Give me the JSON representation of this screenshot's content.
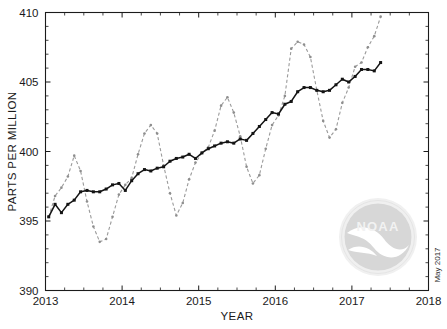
{
  "figure": {
    "watermark_label": "NOAA",
    "date_stamp": "May 2017",
    "logo_name": "noaa-logo-watermark"
  },
  "chart_data": {
    "type": "line",
    "title": "",
    "xlabel": "YEAR",
    "ylabel": "PARTS PER MILLION",
    "xlim": [
      2013,
      2018
    ],
    "ylim": [
      390,
      410
    ],
    "xticks": [
      2013,
      2014,
      2015,
      2016,
      2017,
      2018
    ],
    "xtick_labels": [
      "2013",
      "2014",
      "2015",
      "2016",
      "2017",
      "2018"
    ],
    "yticks": [
      390,
      395,
      400,
      405,
      410
    ],
    "ytick_labels": [
      "390",
      "395",
      "400",
      "405",
      "410"
    ],
    "x_minor_tick_interval": 0.25,
    "y_minor_tick_interval": 1,
    "grid": false,
    "legend_position": "none",
    "series": [
      {
        "name": "Monthly mean CO2",
        "style": "dashed",
        "color": "#9a9a9a",
        "marker": "dot",
        "x": [
          2013.042,
          2013.125,
          2013.208,
          2013.292,
          2013.375,
          2013.458,
          2013.542,
          2013.625,
          2013.708,
          2013.792,
          2013.875,
          2013.958,
          2014.042,
          2014.125,
          2014.208,
          2014.292,
          2014.375,
          2014.458,
          2014.542,
          2014.625,
          2014.708,
          2014.792,
          2014.875,
          2014.958,
          2015.042,
          2015.125,
          2015.208,
          2015.292,
          2015.375,
          2015.458,
          2015.542,
          2015.625,
          2015.708,
          2015.792,
          2015.875,
          2015.958,
          2016.042,
          2016.125,
          2016.208,
          2016.292,
          2016.375,
          2016.458,
          2016.542,
          2016.625,
          2016.708,
          2016.792,
          2016.875,
          2016.958,
          2017.042,
          2017.125,
          2017.208,
          2017.292,
          2017.375
        ],
        "values": [
          395.3,
          396.8,
          397.4,
          398.2,
          399.7,
          398.6,
          396.4,
          394.6,
          393.5,
          393.7,
          395.3,
          396.9,
          397.6,
          398.1,
          399.8,
          401.3,
          401.9,
          401.3,
          399.0,
          397.0,
          395.4,
          396.3,
          398.0,
          399.2,
          399.9,
          400.3,
          401.5,
          403.3,
          403.9,
          402.8,
          401.1,
          398.9,
          397.7,
          398.3,
          400.2,
          401.9,
          402.6,
          404.0,
          407.4,
          407.9,
          407.7,
          406.8,
          404.4,
          402.2,
          401.0,
          401.6,
          403.5,
          404.6,
          406.1,
          406.4,
          407.5,
          408.3,
          409.7
        ]
      },
      {
        "name": "Trend (seasonally corrected)",
        "style": "solid",
        "color": "#141414",
        "marker": "square",
        "x": [
          2013.042,
          2013.125,
          2013.208,
          2013.292,
          2013.375,
          2013.458,
          2013.542,
          2013.625,
          2013.708,
          2013.792,
          2013.875,
          2013.958,
          2014.042,
          2014.125,
          2014.208,
          2014.292,
          2014.375,
          2014.458,
          2014.542,
          2014.625,
          2014.708,
          2014.792,
          2014.875,
          2014.958,
          2015.042,
          2015.125,
          2015.208,
          2015.292,
          2015.375,
          2015.458,
          2015.542,
          2015.625,
          2015.708,
          2015.792,
          2015.875,
          2015.958,
          2016.042,
          2016.125,
          2016.208,
          2016.292,
          2016.375,
          2016.458,
          2016.542,
          2016.625,
          2016.708,
          2016.792,
          2016.875,
          2016.958,
          2017.042,
          2017.125,
          2017.208,
          2017.292,
          2017.375
        ],
        "values": [
          395.3,
          396.2,
          395.6,
          396.2,
          396.5,
          397.1,
          397.2,
          397.1,
          397.1,
          397.3,
          397.6,
          397.7,
          397.2,
          397.9,
          398.4,
          398.7,
          398.6,
          398.8,
          398.9,
          399.3,
          399.5,
          399.6,
          399.8,
          399.5,
          399.9,
          400.2,
          400.4,
          400.6,
          400.7,
          400.6,
          400.9,
          400.8,
          401.3,
          401.8,
          402.3,
          402.8,
          402.7,
          403.4,
          403.6,
          404.3,
          404.6,
          404.6,
          404.4,
          404.3,
          404.4,
          404.8,
          405.2,
          405.0,
          405.4,
          405.9,
          405.9,
          405.8,
          406.4
        ]
      }
    ]
  }
}
